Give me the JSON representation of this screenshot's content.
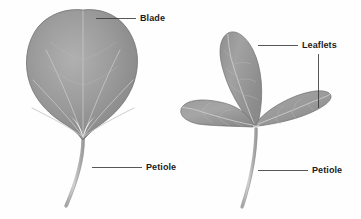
{
  "figure": {
    "background_color": "#fefefe",
    "width": 361,
    "height": 219
  },
  "labels": {
    "blade": "Blade",
    "leaflets": "Leaflets",
    "petiole_left": "Petiole",
    "petiole_right": "Petiole"
  },
  "specimens": [
    {
      "name": "simple-leaf",
      "blade_type": "simple",
      "blade_shape": "cordate",
      "venation": "palmate",
      "leaflet_count": 1,
      "petiole": "long, curved"
    },
    {
      "name": "compound-leaf",
      "blade_type": "compound",
      "blade_shape": "trifoliate",
      "venation": "pinnate",
      "leaflet_count": 3,
      "petiole": "long, curved"
    }
  ],
  "colors": {
    "leaf_fill_light": "#b4b4b4",
    "leaf_fill_mid": "#9a9a9a",
    "leaf_fill_dark": "#7e7e7e",
    "leaf_edge": "#6f6f6f",
    "vein": "#c9c9c9",
    "petiole": "#b6b6b6",
    "petiole_edge": "#8e8e8e",
    "leader_line": "#3a3a3a",
    "label_text": "#1b1b1b"
  },
  "leader_lines": [
    {
      "name": "blade-leader",
      "orientation": "horizontal",
      "from_x": 96,
      "from_y": 18,
      "to_x": 136,
      "to_y": 18
    },
    {
      "name": "leaflets-leader-upper",
      "orientation": "horizontal",
      "from_x": 258,
      "from_y": 45,
      "to_x": 298,
      "to_y": 45
    },
    {
      "name": "leaflets-leader-lower",
      "orientation": "vertical",
      "from_x": 318,
      "from_y": 55,
      "to_x": 318,
      "to_y": 108
    },
    {
      "name": "petiole-left-leader",
      "orientation": "horizontal",
      "from_x": 92,
      "from_y": 167,
      "to_x": 142,
      "to_y": 167
    },
    {
      "name": "petiole-right-leader",
      "orientation": "horizontal",
      "from_x": 258,
      "from_y": 170,
      "to_x": 308,
      "to_y": 170
    }
  ]
}
